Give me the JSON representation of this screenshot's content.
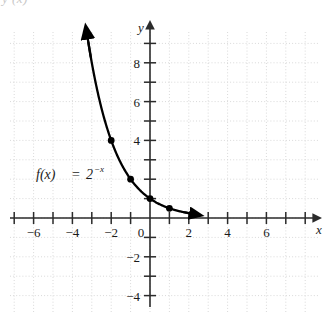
{
  "figure": {
    "clipped_top_caption": "y (x)",
    "function_label": {
      "name": "f(x)",
      "equals": "=",
      "base": "2",
      "exponent": "−x",
      "full": "f(x) = 2^(−x)"
    },
    "colors": {
      "axis": "#2b2b2b",
      "curve": "#000000",
      "grid": "#d9d9d9",
      "text": "#1a1a1a",
      "background": "#ffffff",
      "clipped_caption": "#c8c8c8"
    }
  },
  "chart_data": {
    "type": "line",
    "title": "",
    "subtitle": "",
    "xlabel": "x",
    "ylabel": "y",
    "function": "f(x) = 2^(-x)",
    "xlim": [
      -7.5,
      8.5
    ],
    "ylim": [
      -5.5,
      10.5
    ],
    "grid": true,
    "grid_spacing": 1,
    "tick_spacing": 1,
    "legend_position": "none",
    "annotations": [
      {
        "text": "f(x) = 2^(−x)",
        "x": -5.2,
        "y": 2.1
      }
    ],
    "xticks": [
      -7,
      -6,
      -5,
      -4,
      -3,
      -2,
      -1,
      0,
      1,
      2,
      3,
      4,
      5,
      6,
      7,
      8
    ],
    "xtick_labels": [
      {
        "value": -6,
        "label": "−6"
      },
      {
        "value": -4,
        "label": "−4"
      },
      {
        "value": -2,
        "label": "−2"
      },
      {
        "value": 0,
        "label": "0"
      },
      {
        "value": 2,
        "label": "2"
      },
      {
        "value": 4,
        "label": "4"
      },
      {
        "value": 6,
        "label": "6"
      }
    ],
    "yticks": [
      -5,
      -4,
      -3,
      -2,
      -1,
      1,
      2,
      3,
      4,
      5,
      6,
      7,
      8,
      9,
      10
    ],
    "ytick_labels": [
      {
        "value": 8,
        "label": "8"
      },
      {
        "value": 6,
        "label": "6"
      },
      {
        "value": 4,
        "label": "4"
      },
      {
        "value": -2,
        "label": "−2"
      },
      {
        "value": -4,
        "label": "−4"
      }
    ],
    "x": [
      -3.2,
      -3.0,
      -2.5,
      -2.0,
      -1.5,
      -1.0,
      -0.5,
      0.0,
      0.5,
      1.0,
      1.5,
      2.0
    ],
    "y": [
      9.19,
      8.0,
      5.66,
      4.0,
      2.83,
      2.0,
      1.41,
      1.0,
      0.71,
      0.5,
      0.35,
      0.25
    ],
    "marked_points": [
      {
        "x": -2,
        "y": 4,
        "label": "(−2, 4)"
      },
      {
        "x": -1,
        "y": 2,
        "label": "(−1, 2)"
      },
      {
        "x": 0,
        "y": 1,
        "label": "(0, 1)"
      },
      {
        "x": 1,
        "y": 0.5,
        "label": "(1, 0.5)"
      }
    ],
    "curve_arrows": [
      "upper-left-end",
      "lower-right-end"
    ]
  }
}
